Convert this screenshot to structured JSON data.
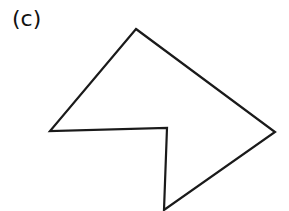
{
  "figure": {
    "label": "(c)",
    "stroke_color": "#1a1a1a",
    "fill_color": "#ffffff",
    "polygon_points": "136,29 275,132 164,210 167,128 50,131"
  }
}
